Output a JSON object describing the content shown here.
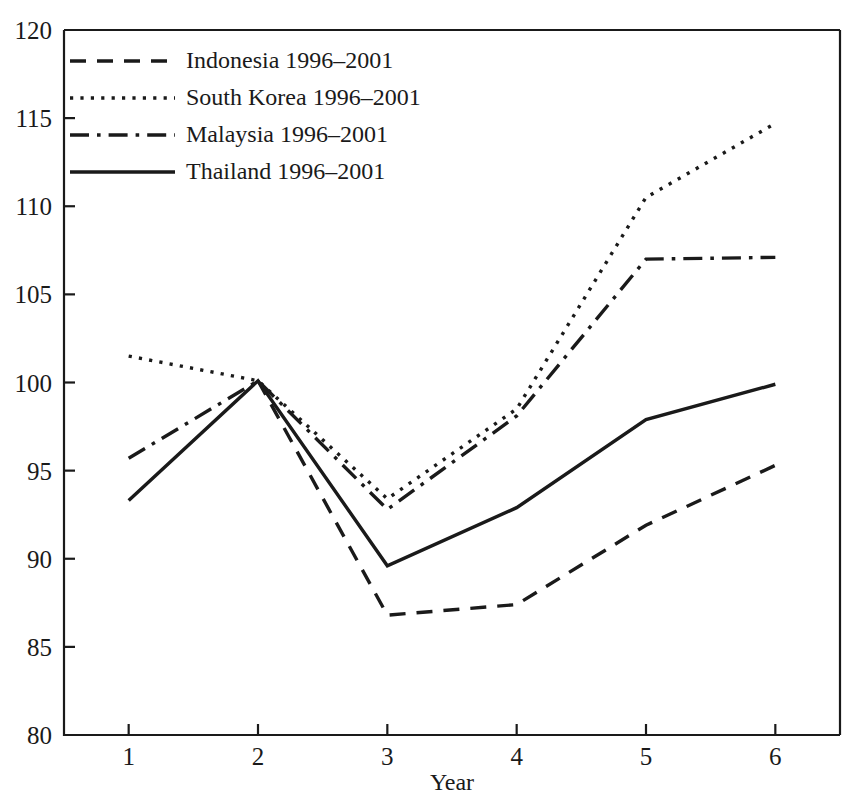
{
  "chart_data": {
    "type": "line",
    "title": "",
    "xlabel": "Year",
    "ylabel": "",
    "x": [
      1,
      2,
      3,
      4,
      5,
      6
    ],
    "xticklabels": [
      "1",
      "2",
      "3",
      "4",
      "5",
      "6"
    ],
    "yticklabels": [
      "80",
      "85",
      "90",
      "95",
      "100",
      "105",
      "110",
      "115",
      "120"
    ],
    "yticks": [
      80,
      85,
      90,
      95,
      100,
      105,
      110,
      115,
      120
    ],
    "xlim": [
      0.5,
      6.5
    ],
    "ylim": [
      80,
      120
    ],
    "grid": false,
    "legend_position": "top-left",
    "series": [
      {
        "name": "Indonesia 1996–2001",
        "style": "dashed",
        "values": [
          null,
          100.1,
          86.8,
          87.4,
          91.9,
          95.3
        ]
      },
      {
        "name": "South Korea 1996–2001",
        "style": "dotted",
        "values": [
          101.5,
          100.1,
          93.4,
          98.5,
          110.5,
          114.7
        ]
      },
      {
        "name": "Malaysia 1996–2001",
        "style": "dashdot",
        "values": [
          95.7,
          100.1,
          92.8,
          98.1,
          107.0,
          107.1
        ]
      },
      {
        "name": "Thailand 1996–2001",
        "style": "solid",
        "values": [
          93.3,
          100.1,
          89.6,
          92.9,
          97.9,
          99.9
        ]
      }
    ]
  },
  "legend": {
    "entries": [
      {
        "label": "Indonesia 1996–2001"
      },
      {
        "label": "South Korea 1996–2001"
      },
      {
        "label": "Malaysia 1996–2001"
      },
      {
        "label": "Thailand 1996–2001"
      }
    ]
  },
  "axes": {
    "x_title": "Year"
  }
}
